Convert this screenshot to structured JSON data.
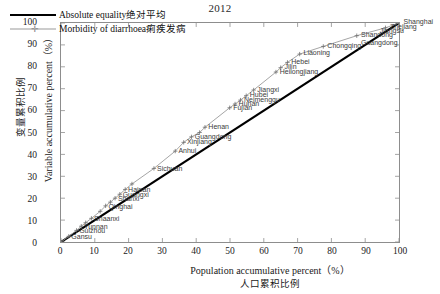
{
  "chart": {
    "title": "2012",
    "xlabel_en": "Population accumulative percent（%）",
    "xlabel_cn": "人口累积比例",
    "ylabel_en": "Variable accumulative percent（%）",
    "ylabel_cn": "变量累积比例"
  },
  "legend": {
    "items": [
      {
        "label": "Absolute equality绝对平均",
        "style": "solid",
        "color": "#000000"
      },
      {
        "label": "Morbidity of diarrhoea痢疾发病",
        "style": "dash-marker",
        "color": "#9a9a9a"
      }
    ]
  },
  "chart_data": {
    "type": "line",
    "title": "2012",
    "xlabel": "Population accumulative percent（%） 人口累积比例",
    "ylabel": "Variable accumulative percent（%） 变量累积比例",
    "xlim": [
      0,
      100
    ],
    "ylim": [
      0,
      100
    ],
    "xticks": [
      0,
      10,
      20,
      30,
      40,
      50,
      60,
      70,
      80,
      90,
      100
    ],
    "yticks": [
      0,
      10,
      20,
      30,
      40,
      50,
      60,
      70,
      80,
      90,
      100
    ],
    "grid": false,
    "legend_position": "top-left",
    "series": [
      {
        "name": "Absolute equality绝对平均",
        "type": "line",
        "color": "#000000",
        "x": [
          0,
          100
        ],
        "values": [
          0,
          100
        ]
      },
      {
        "name": "Morbidity of diarrhoea痢疾发病",
        "type": "line-marker",
        "color": "#9a9a9a",
        "x": [
          0.0,
          2.3,
          4.6,
          6.0,
          7.3,
          9.0,
          11.6,
          13.2,
          14.6,
          16.0,
          17.4,
          19.0,
          21.0,
          27.5,
          33.8,
          36.3,
          38.6,
          41.0,
          42.6,
          49.9,
          51.5,
          53.1,
          54.8,
          57.0,
          63.6,
          65.0,
          67.0,
          70.6,
          77.6,
          87.5,
          96.0,
          100.0
        ],
        "values": [
          0.0,
          2.6,
          5.3,
          7.2,
          8.8,
          10.8,
          14.0,
          16.5,
          18.2,
          20.0,
          21.8,
          24.0,
          26.5,
          33.6,
          41.5,
          45.5,
          48.0,
          50.0,
          52.4,
          61.3,
          63.0,
          64.8,
          66.8,
          69.4,
          77.6,
          79.6,
          82.0,
          85.8,
          89.3,
          94.2,
          97.8,
          100.0
        ],
        "point_labels": [
          {
            "name": "Gansu",
            "x": 2.3,
            "y": 2.6
          },
          {
            "name": "Guizhou",
            "x": 4.6,
            "y": 5.3
          },
          {
            "name": "Yunnan",
            "x": 6.0,
            "y": 7.2
          },
          {
            "name": "Shaanxi",
            "x": 9.0,
            "y": 10.8
          },
          {
            "name": "Qinghai",
            "x": 13.2,
            "y": 16.5
          },
          {
            "name": "Shanxi",
            "x": 16.0,
            "y": 20.0
          },
          {
            "name": "Guangxi",
            "x": 17.4,
            "y": 21.8
          },
          {
            "name": "Hainan",
            "x": 19.0,
            "y": 24.0
          },
          {
            "name": "Sichuan",
            "x": 27.5,
            "y": 33.6
          },
          {
            "name": "Anhui",
            "x": 33.8,
            "y": 41.5
          },
          {
            "name": "Xinjiang",
            "x": 36.3,
            "y": 45.5
          },
          {
            "name": "Guangdong",
            "x": 38.6,
            "y": 48.0
          },
          {
            "name": "Henan",
            "x": 42.6,
            "y": 52.4
          },
          {
            "name": "Fujian",
            "x": 49.9,
            "y": 61.3
          },
          {
            "name": "Hunan",
            "x": 51.5,
            "y": 63.0
          },
          {
            "name": "Neimenggu",
            "x": 53.1,
            "y": 64.8
          },
          {
            "name": "Hubei",
            "x": 54.8,
            "y": 66.8
          },
          {
            "name": "Jiangxi",
            "x": 57.0,
            "y": 69.4
          },
          {
            "name": "Heilongjiang",
            "x": 63.6,
            "y": 77.6
          },
          {
            "name": "Jilin",
            "x": 65.0,
            "y": 79.6
          },
          {
            "name": "Hebei",
            "x": 67.0,
            "y": 82.0
          },
          {
            "name": "Liaoning",
            "x": 70.6,
            "y": 85.8
          },
          {
            "name": "Chongqing",
            "x": 77.6,
            "y": 89.3
          },
          {
            "name": "Shandong",
            "x": 87.5,
            "y": 94.2
          },
          {
            "name": "Guangdong",
            "x": 87.5,
            "y": 90.5
          },
          {
            "name": "Jiangsu",
            "x": 93.0,
            "y": 96.0
          },
          {
            "name": "Zhejiang",
            "x": 96.0,
            "y": 97.8
          },
          {
            "name": "Shanghai",
            "x": 100.0,
            "y": 100.0
          }
        ]
      }
    ]
  }
}
